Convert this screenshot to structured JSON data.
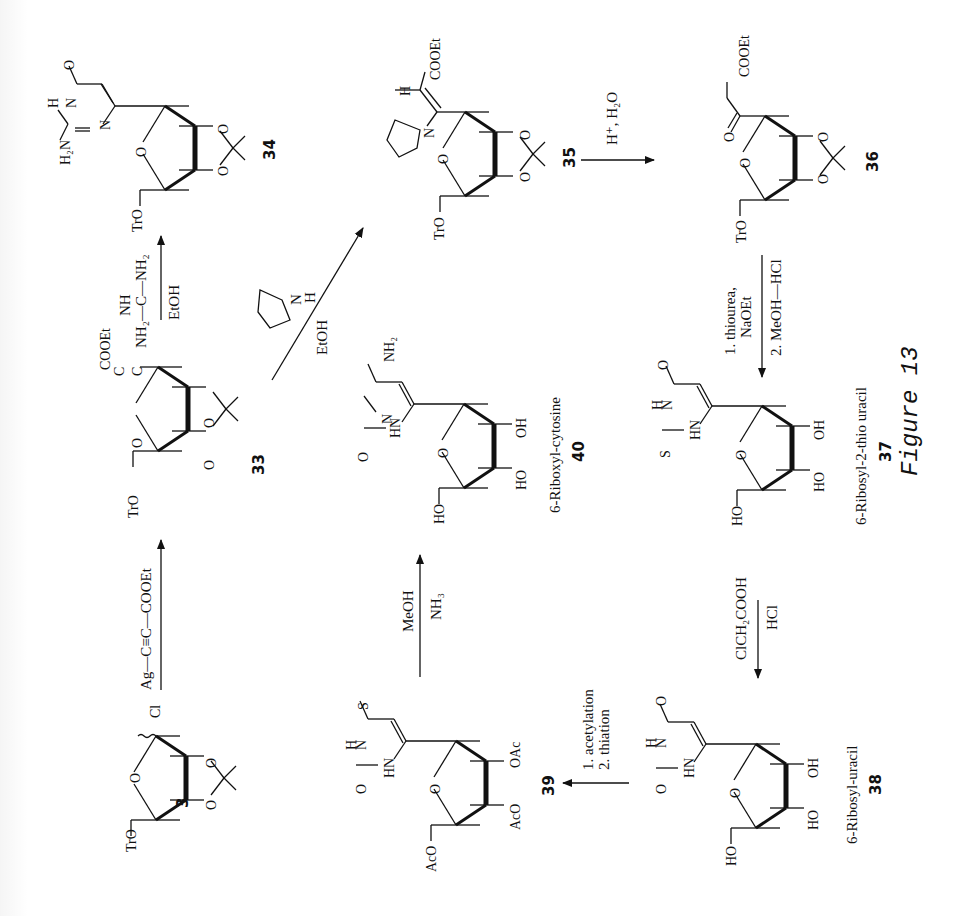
{
  "figure": {
    "caption": "Figure 13",
    "orientation": "rotated 90° (text reads bottom-to-top)"
  },
  "compounds": [
    {
      "id": "3",
      "label": "3",
      "substituents": {
        "anomeric": "Cl",
        "c5": "TrO",
        "protection": "2,3-O-isopropylidene"
      }
    },
    {
      "id": "33",
      "label": "33",
      "substituents": {
        "side_chain": "C≡C–COOEt",
        "c5": "TrO",
        "protection": "2,3-O-isopropylidene"
      }
    },
    {
      "id": "34",
      "label": "34",
      "substituents": {
        "base": "2-amino-4(3H)-pyrimidinone",
        "atoms": [
          "O",
          "H",
          "N",
          "H2N",
          "N"
        ],
        "c5": "TrO"
      }
    },
    {
      "id": "35",
      "label": "35",
      "substituents": {
        "side_chain": "C(N-pyrrolidinyl)=CH–COOEt",
        "atoms": [
          "H",
          "COOEt",
          "N"
        ],
        "c5": "TrO"
      }
    },
    {
      "id": "36",
      "label": "36",
      "substituents": {
        "side_chain": "C(=O)–CH2–COOEt",
        "atoms": [
          "O",
          "COOEt"
        ],
        "c5": "TrO"
      }
    },
    {
      "id": "37",
      "label": "37",
      "name": "6-Ribosyl-2-thio uracil",
      "substituents": {
        "atoms": [
          "O",
          "H",
          "N",
          "S",
          "HN",
          "OH",
          "HO",
          "HO"
        ]
      }
    },
    {
      "id": "38",
      "label": "38",
      "name": "6-Ribosyl-uracil",
      "substituents": {
        "atoms": [
          "O",
          "H",
          "N",
          "O",
          "HN",
          "OH",
          "HO",
          "HO"
        ]
      }
    },
    {
      "id": "39",
      "label": "39",
      "substituents": {
        "atoms": [
          "S",
          "H",
          "N",
          "O",
          "HN",
          "OAc",
          "AcO",
          "AcO"
        ]
      }
    },
    {
      "id": "40",
      "label": "40",
      "name": "6-Riboxyl-cytosine",
      "substituents": {
        "atoms": [
          "NH2",
          "N",
          "O",
          "HN",
          "OH",
          "HO",
          "HO"
        ]
      }
    }
  ],
  "reactions": [
    {
      "from": "3",
      "to": "33",
      "above": "Ag—C≡C—COOEt",
      "below": ""
    },
    {
      "from": "33",
      "to": "34",
      "above": "NH2—C(=NH)—NH2",
      "below": "EtOH"
    },
    {
      "from": "33",
      "to": "35",
      "above": "pyrrolidine (N–H)",
      "below": "EtOH"
    },
    {
      "from": "35",
      "to": "36",
      "above": "H+, H2O",
      "below": ""
    },
    {
      "from": "36",
      "to": "37",
      "above": "1. thiourea, NaOEt",
      "below": "2. MeOH—HCl"
    },
    {
      "from": "37",
      "to": "38",
      "above": "ClCH2COOH",
      "below": "HCl"
    },
    {
      "from": "38",
      "to": "39",
      "above": "1. acetylation",
      "below": "2. thiation"
    },
    {
      "from": "39",
      "to": "40",
      "above": "MeOH",
      "below": "NH3"
    }
  ],
  "text": {
    "c3": "3",
    "c33": "33",
    "c34": "34",
    "c35": "35",
    "c36": "36",
    "c37": "37",
    "c38": "38",
    "c39": "39",
    "c40": "40",
    "n37": "6-Ribosyl-2-thio uracil",
    "n38": "6-Ribosyl-uracil",
    "n40": "6-Riboxyl-cytosine",
    "r1": "Ag—C≡C—COOEt",
    "r2a": "NH",
    "r2b": "NH₂—C—NH₂",
    "r2c": "EtOH",
    "r3a": "N",
    "r3b": "H",
    "r3c": "EtOH",
    "r4": "H⁺, H₂O",
    "r5a": "1. thiourea,",
    "r5b": "NaOEt",
    "r5c": "2. MeOH—HCl",
    "r6a": "ClCH₂COOH",
    "r6b": "HCl",
    "r7a": "1. acetylation",
    "r7b": "2. thiation",
    "r8a": "MeOH",
    "r8b": "NH₃",
    "fig": "Figure 13",
    "TrO": "TrO",
    "Cl": "Cl",
    "COOEt": "COOEt",
    "C": "C",
    "O": "O",
    "H": "H",
    "N": "N",
    "HN": "HN",
    "H2N": "H₂N",
    "NH2": "NH₂",
    "S": "S",
    "OH": "OH",
    "HO": "HO",
    "OAc": "OAc",
    "AcO": "AcO"
  }
}
